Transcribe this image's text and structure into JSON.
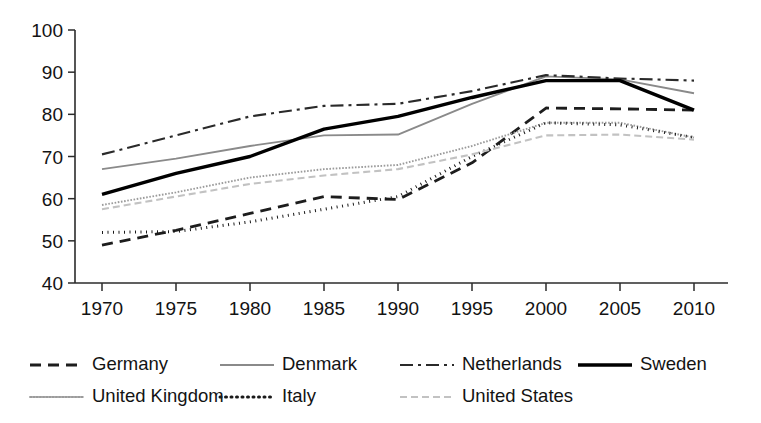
{
  "chart_data": {
    "type": "line",
    "title": "",
    "subtitle": "",
    "xlabel": "",
    "ylabel": "",
    "x": [
      1970,
      1975,
      1980,
      1985,
      1990,
      1995,
      2000,
      2005,
      2010
    ],
    "xtick_labels": [
      "1970",
      "1975",
      "1980",
      "1985",
      "1990",
      "1995",
      "2000",
      "2005",
      "2010"
    ],
    "ytick_labels": [
      "40",
      "50",
      "60",
      "70",
      "80",
      "90",
      "100"
    ],
    "yticks": [
      40,
      50,
      60,
      70,
      80,
      90,
      100
    ],
    "xlim": [
      1970,
      2010
    ],
    "ylim": [
      40,
      100
    ],
    "grid": false,
    "legend_position": "below",
    "series": [
      {
        "name": "Germany",
        "values": [
          49.0,
          52.5,
          56.5,
          60.5,
          59.8,
          68.5,
          81.5,
          81.3,
          81.0
        ],
        "style": "dashed",
        "color": "#1d1d1d",
        "width": 2.8,
        "dash": "11,7"
      },
      {
        "name": "Denmark",
        "values": [
          67.0,
          69.5,
          72.5,
          75.0,
          75.2,
          82.5,
          89.0,
          88.3,
          85.0
        ],
        "style": "solid",
        "color": "#8a8a8a",
        "width": 1.9,
        "dash": "none"
      },
      {
        "name": "Netherlands",
        "values": [
          70.5,
          75.0,
          79.5,
          82.0,
          82.5,
          85.5,
          89.3,
          88.5,
          88.0
        ],
        "style": "dash-dot",
        "color": "#2a2a2a",
        "width": 2.1,
        "dash": "13,5,3,5"
      },
      {
        "name": "Sweden",
        "values": [
          61.0,
          66.0,
          70.0,
          76.5,
          79.5,
          84.0,
          88.0,
          88.0,
          81.0
        ],
        "style": "solid",
        "color": "#000000",
        "width": 3.4,
        "dash": "none"
      },
      {
        "name": "United Kingdom",
        "values": [
          58.5,
          61.5,
          65.0,
          67.0,
          68.0,
          72.5,
          78.0,
          78.0,
          74.5
        ],
        "style": "fine-dotted",
        "color": "#9b9b9b",
        "width": 1.9,
        "dash": "1.6,1.6"
      },
      {
        "name": "Italy",
        "values": [
          52.0,
          52.2,
          54.5,
          57.5,
          60.5,
          70.0,
          78.0,
          77.5,
          74.5
        ],
        "style": "dotted",
        "color": "#1a1a1a",
        "width": 3.0,
        "dash": "1,4.5"
      },
      {
        "name": "United States",
        "values": [
          57.5,
          60.5,
          63.5,
          65.5,
          67.0,
          70.5,
          75.0,
          75.2,
          74.0
        ],
        "style": "light-dashed",
        "color": "#c2c2c2",
        "width": 2.1,
        "dash": "7,4"
      }
    ],
    "legend": [
      {
        "label": "Germany",
        "series": "Germany"
      },
      {
        "label": "Denmark",
        "series": "Denmark"
      },
      {
        "label": "Netherlands",
        "series": "Netherlands"
      },
      {
        "label": "Sweden",
        "series": "Sweden"
      },
      {
        "label": "United Kingdom",
        "series": "United Kingdom"
      },
      {
        "label": "Italy",
        "series": "Italy"
      },
      {
        "label": "United States",
        "series": "United States"
      }
    ]
  },
  "geometry": {
    "plot_left": 102,
    "plot_right": 694,
    "plot_top": 30,
    "plot_bottom": 283,
    "axis_x": 75,
    "legend_row1_y": 365,
    "legend_row2_y": 397,
    "legend_cols_row1": [
      30,
      220,
      400,
      578
    ],
    "legend_cols_row2": [
      30,
      220,
      400
    ],
    "legend_swatch_len": 54,
    "legend_text_gap": 8
  }
}
